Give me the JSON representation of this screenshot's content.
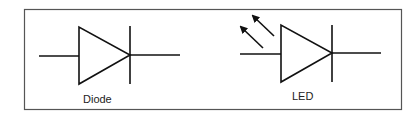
{
  "figure": {
    "frame": {
      "x": 24,
      "y": 9,
      "width": 377,
      "height": 100,
      "stroke": "#555555"
    },
    "symbols": [
      {
        "name": "diode",
        "label": "Diode",
        "label_pos": [
          83,
          93
        ]
      },
      {
        "name": "led",
        "label": "LED",
        "label_pos": [
          290,
          90
        ],
        "emission_arrows": 2
      }
    ],
    "stroke_color": "#111111"
  }
}
